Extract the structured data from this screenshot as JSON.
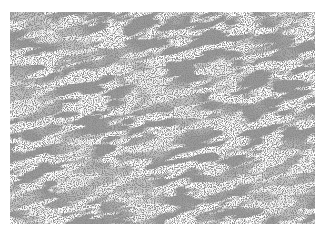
{
  "image": {
    "description": "Grayscale micrograph-like texture of elongated, wavy light tubular structures on a mottled gray background",
    "colors": {
      "background": "#ffffff",
      "base_gray": "#9a9a9a",
      "light_streaks": "#e6e6e6",
      "dark_speckle": "#4a4a4a"
    }
  }
}
